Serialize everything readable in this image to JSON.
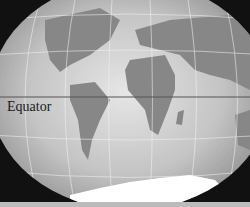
{
  "map": {
    "title": "World map projection",
    "labels": {
      "equator": "Equator"
    },
    "colors": {
      "ocean_light": "#d9d9d9",
      "ocean_dark": "#9a9a9a",
      "land": "#8a8a8a",
      "antarctica": "#ffffff",
      "grid": "#eeeeee",
      "equator_line": "#555555",
      "background": "#111111"
    }
  }
}
